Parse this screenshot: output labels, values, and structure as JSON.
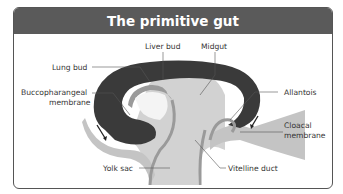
{
  "title": "The primitive gut",
  "labels": {
    "liver_bud": "Liver bud",
    "midgut": "Midgut",
    "lung_bud": "Lung bud",
    "buccopharangeal_1": "Buccopharangeal",
    "buccopharangeal_2": "membrane",
    "allantois": "Allantois",
    "cloacal_1": "Cloacal",
    "cloacal_2": "membrane",
    "yolk_sac": "Yolk sac",
    "vitelline_duct": "Vitelline duct"
  },
  "colors": {
    "header": "#5a5a5a",
    "dark_tissue": "#3a3a3a",
    "mid_tissue": "#9a9a9a",
    "light_tissue": "#d2d2d2",
    "lumen": "#f4f4f4"
  }
}
